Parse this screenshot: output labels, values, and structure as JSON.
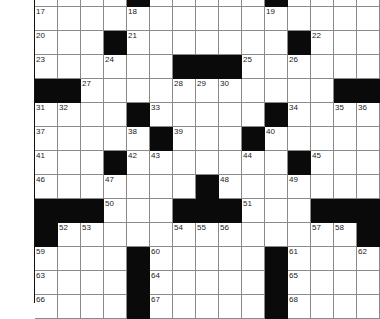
{
  "puzzle": {
    "cols": 15,
    "cell_width": 23,
    "cell_height": 24,
    "colors": {
      "black": "#0a0a0a",
      "white": "#ffffff",
      "grid_line": "#8a8a8a"
    },
    "rows": [
      {
        "blacks": [
          4,
          10
        ],
        "numbers": {}
      },
      {
        "blacks": [],
        "numbers": {
          "0": "17",
          "4": "18",
          "10": "19"
        }
      },
      {
        "blacks": [
          3,
          11
        ],
        "numbers": {
          "0": "20",
          "4": "21",
          "12": "22"
        }
      },
      {
        "blacks": [
          6,
          7,
          8
        ],
        "numbers": {
          "0": "23",
          "3": "24",
          "9": "25",
          "11": "26"
        }
      },
      {
        "blacks": [
          0,
          1,
          13,
          14
        ],
        "numbers": {
          "2": "27",
          "6": "28",
          "7": "29",
          "8": "30"
        }
      },
      {
        "blacks": [
          4,
          10
        ],
        "numbers": {
          "0": "31",
          "1": "32",
          "5": "33",
          "11": "34",
          "13": "35",
          "14": "36"
        }
      },
      {
        "blacks": [
          5,
          9
        ],
        "numbers": {
          "0": "37",
          "4": "38",
          "6": "39",
          "10": "40"
        }
      },
      {
        "blacks": [
          3,
          11
        ],
        "numbers": {
          "0": "41",
          "4": "42",
          "5": "43",
          "9": "44",
          "12": "45"
        }
      },
      {
        "blacks": [
          7
        ],
        "numbers": {
          "0": "46",
          "3": "47",
          "8": "48",
          "11": "49"
        }
      },
      {
        "blacks": [
          0,
          1,
          2,
          6,
          7,
          8,
          12,
          13,
          14
        ],
        "numbers": {
          "3": "50",
          "9": "51"
        }
      },
      {
        "blacks": [
          0,
          14
        ],
        "numbers": {
          "1": "52",
          "2": "53",
          "6": "54",
          "7": "55",
          "8": "56",
          "12": "57",
          "13": "58"
        }
      },
      {
        "blacks": [
          4,
          10
        ],
        "numbers": {
          "0": "59",
          "5": "60",
          "11": "61",
          "14": "62"
        }
      },
      {
        "blacks": [
          4,
          10
        ],
        "numbers": {
          "0": "63",
          "5": "64",
          "11": "65"
        }
      },
      {
        "blacks": [
          4,
          10
        ],
        "numbers": {
          "0": "66",
          "5": "67",
          "11": "68"
        }
      }
    ]
  }
}
